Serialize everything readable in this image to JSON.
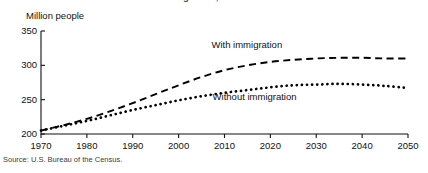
{
  "figure": {
    "title_clipped": "immigration, 1970-2050",
    "source": "Source: U.S. Bureau of the Census."
  },
  "chart_data": {
    "type": "line",
    "title": "immigration, 1970-2050",
    "xlabel": "",
    "ylabel": "Million people",
    "xlim": [
      1970,
      2050
    ],
    "ylim": [
      200,
      350
    ],
    "grid": false,
    "legend": "inline-annotation",
    "xticks": [
      "1970",
      "1980",
      "1990",
      "2000",
      "2010",
      "2020",
      "2030",
      "2040",
      "2050"
    ],
    "yticks": [
      "200",
      "250",
      "300",
      "350"
    ],
    "x": [
      1970,
      1975,
      1980,
      1985,
      1990,
      1995,
      2000,
      2005,
      2010,
      2015,
      2020,
      2025,
      2030,
      2035,
      2040,
      2045,
      2050
    ],
    "series": [
      {
        "name": "With immigration",
        "style": "dashed",
        "label_x": 2015,
        "label_y": 328,
        "values": [
          205,
          213,
          222,
          233,
          245,
          258,
          271,
          283,
          293,
          300,
          305,
          308,
          310,
          311,
          311,
          310,
          310
        ]
      },
      {
        "name": "Without immigration",
        "style": "dotted",
        "label_x": 2017,
        "label_y": 252,
        "values": [
          205,
          212,
          219,
          227,
          235,
          242,
          249,
          255,
          260,
          264,
          268,
          271,
          272,
          273,
          272,
          270,
          267
        ]
      }
    ],
    "annotations": [
      {
        "text": "With immigration",
        "x": 2015,
        "y": 328
      },
      {
        "text": "Without immigration",
        "x": 2017,
        "y": 252
      }
    ]
  },
  "axis_geometry": {
    "left_px": 41,
    "right_px": 408,
    "top_px": 31,
    "bottom_px": 134
  },
  "labels": {
    "ylabel": "Million people",
    "series_with": "With immigration",
    "series_without": "Without immigration"
  }
}
